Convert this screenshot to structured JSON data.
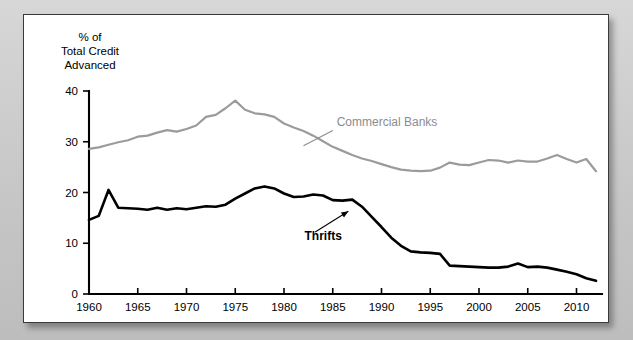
{
  "figure": {
    "panel_background": "#ffffff",
    "outer_background": "#cfcfcf",
    "border_color": "#3a3a3a"
  },
  "chart_data": {
    "type": "line",
    "title": "",
    "subtitle": "",
    "xlabel": "",
    "ylabel": "% of Total Credit Advanced",
    "ylabel_lines": [
      "% of",
      "Total Credit",
      "Advanced"
    ],
    "xlim": [
      1960,
      2012
    ],
    "ylim": [
      0,
      40
    ],
    "yticks": [
      0,
      10,
      20,
      30,
      40
    ],
    "ytick_labels": [
      "0",
      "10",
      "20",
      "30",
      "40"
    ],
    "xticks": [
      1960,
      1965,
      1970,
      1975,
      1980,
      1985,
      1990,
      1995,
      2000,
      2005,
      2010
    ],
    "xtick_labels": [
      "1960",
      "1965",
      "1970",
      "1975",
      "1980",
      "1985",
      "1990",
      "1995",
      "2000",
      "2005",
      "2010"
    ],
    "grid": false,
    "legend": "inline-annotations",
    "legend_position": "inline",
    "series": [
      {
        "name": "Commercial Banks",
        "color": "#9b9b9b",
        "label_x": 1985.4,
        "label_y": 33.1,
        "leader_from": [
          1985.0,
          32.2
        ],
        "leader_to": [
          1982.0,
          29.2
        ],
        "x": [
          1960,
          1961,
          1962,
          1963,
          1964,
          1965,
          1966,
          1967,
          1968,
          1969,
          1970,
          1971,
          1972,
          1973,
          1974,
          1975,
          1976,
          1977,
          1978,
          1979,
          1980,
          1981,
          1982,
          1983,
          1984,
          1985,
          1986,
          1987,
          1988,
          1989,
          1990,
          1991,
          1992,
          1993,
          1994,
          1995,
          1996,
          1997,
          1998,
          1999,
          2000,
          2001,
          2002,
          2003,
          2004,
          2005,
          2006,
          2007,
          2008,
          2009,
          2010,
          2011,
          2012
        ],
        "values": [
          28.6,
          28.9,
          29.4,
          29.9,
          30.3,
          31.0,
          31.2,
          31.8,
          32.3,
          32.0,
          32.5,
          33.2,
          34.9,
          35.3,
          36.6,
          38.1,
          36.3,
          35.6,
          35.4,
          34.9,
          33.6,
          32.8,
          32.1,
          31.2,
          30.1,
          29.0,
          28.2,
          27.4,
          26.7,
          26.2,
          25.6,
          25.0,
          24.5,
          24.3,
          24.2,
          24.3,
          24.9,
          25.9,
          25.5,
          25.4,
          25.9,
          26.4,
          26.3,
          25.9,
          26.3,
          26.1,
          26.1,
          26.7,
          27.4,
          26.6,
          25.9,
          26.6,
          24.2
        ]
      },
      {
        "name": "Thrifts",
        "color": "#000000",
        "label_x": 1982.1,
        "label_y": 10.6,
        "leader_from": [
          1983.2,
          12.2
        ],
        "leader_to": [
          1986.6,
          16.3
        ],
        "x": [
          1960,
          1961,
          1962,
          1963,
          1964,
          1965,
          1966,
          1967,
          1968,
          1969,
          1970,
          1971,
          1972,
          1973,
          1974,
          1975,
          1976,
          1977,
          1978,
          1979,
          1980,
          1981,
          1982,
          1983,
          1984,
          1985,
          1986,
          1987,
          1988,
          1989,
          1990,
          1991,
          1992,
          1993,
          1994,
          1995,
          1996,
          1997,
          1998,
          1999,
          2000,
          2001,
          2002,
          2003,
          2004,
          2005,
          2006,
          2007,
          2008,
          2009,
          2010,
          2011,
          2012
        ],
        "values": [
          14.6,
          15.4,
          20.5,
          17.0,
          16.9,
          16.8,
          16.6,
          17.0,
          16.6,
          16.9,
          16.7,
          17.0,
          17.3,
          17.2,
          17.6,
          18.8,
          19.8,
          20.8,
          21.2,
          20.8,
          19.8,
          19.1,
          19.2,
          19.6,
          19.4,
          18.5,
          18.4,
          18.6,
          17.2,
          15.2,
          13.2,
          11.1,
          9.5,
          8.4,
          8.2,
          8.1,
          7.9,
          5.6,
          5.5,
          5.4,
          5.3,
          5.2,
          5.2,
          5.4,
          6.0,
          5.3,
          5.4,
          5.2,
          4.8,
          4.4,
          3.9,
          3.1,
          2.6
        ]
      }
    ]
  }
}
